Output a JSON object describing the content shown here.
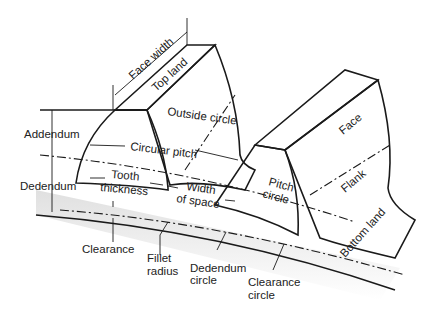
{
  "diagram": {
    "labels": {
      "face_width": "Face width",
      "top_land": "Top land",
      "outside_circle": "Outside circle",
      "addendum": "Addendum",
      "circular_pitch": "Circular pitch",
      "dedendum": "Dedendum",
      "tooth_thickness_1": "Tooth",
      "tooth_thickness_2": "thickness",
      "width_of_space_1": "Width",
      "width_of_space_2": "of space",
      "pitch_circle_1": "Pitch",
      "pitch_circle_2": "circle",
      "face": "Face",
      "flank": "Flank",
      "bottom_land": "Bottom land",
      "clearance": "Clearance",
      "fillet_radius_1": "Fillet",
      "fillet_radius_2": "radius",
      "dedendum_circle_1": "Dedendum",
      "dedendum_circle_2": "circle",
      "clearance_circle_1": "Clearance",
      "clearance_circle_2": "circle"
    },
    "colors": {
      "face_light": "#f2f2f2",
      "face_mid": "#d9d9d9",
      "face_dark": "#c4c4c4",
      "line": "#1a1a1a"
    }
  }
}
